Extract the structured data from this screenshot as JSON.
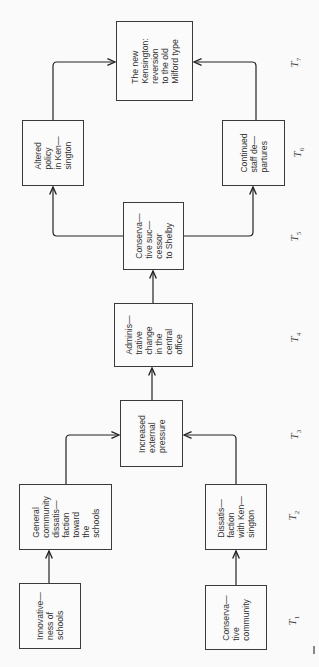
{
  "diagram": {
    "orientation": "rotated-90-ccw",
    "nodes": [
      {
        "id": "innovativeness",
        "label": "Innovative—\nness of\nschools",
        "time": "T1"
      },
      {
        "id": "conservative_community",
        "label": "Conserva—\ntive\ncommunity",
        "time": "T1"
      },
      {
        "id": "general_dissatisfaction",
        "label": "General\ncommunity\ndissatis—\nfaction\ntoward\nthe\nschools",
        "time": "T2"
      },
      {
        "id": "dissatisfaction_kensington",
        "label": "Dissatis—\nfaction\nwith Ken—\nsington",
        "time": "T2"
      },
      {
        "id": "external_pressure",
        "label": "Increased\nexternal\npressure",
        "time": "T3"
      },
      {
        "id": "admin_change",
        "label": "Adminis—\ntrative\nchange\nin the\ncentral\noffice",
        "time": "T4"
      },
      {
        "id": "conservative_successor",
        "label": "Conserva—\ntive suc—\ncessor\nto Shelby",
        "time": "T5"
      },
      {
        "id": "altered_policy",
        "label": "Altered\npolicy\nin Ken—\nsington",
        "time": "T6"
      },
      {
        "id": "staff_departures",
        "label": "Continued\nstaff de—\npartures",
        "time": "T6"
      },
      {
        "id": "new_kensington",
        "label": "The new\nKensington:\nreversion\nto the old\nMilford type",
        "time": "T7"
      }
    ],
    "edges": [
      [
        "innovativeness",
        "general_dissatisfaction"
      ],
      [
        "conservative_community",
        "dissatisfaction_kensington"
      ],
      [
        "general_dissatisfaction",
        "external_pressure"
      ],
      [
        "dissatisfaction_kensington",
        "external_pressure"
      ],
      [
        "external_pressure",
        "admin_change"
      ],
      [
        "admin_change",
        "conservative_successor"
      ],
      [
        "conservative_successor",
        "altered_policy"
      ],
      [
        "conservative_successor",
        "staff_departures"
      ],
      [
        "altered_policy",
        "new_kensington"
      ],
      [
        "staff_departures",
        "new_kensington"
      ]
    ],
    "time_labels": [
      {
        "base": "T",
        "sub": "1"
      },
      {
        "base": "T",
        "sub": "2"
      },
      {
        "base": "T",
        "sub": "3"
      },
      {
        "base": "T",
        "sub": "4"
      },
      {
        "base": "T",
        "sub": "5"
      },
      {
        "base": "T",
        "sub": "6"
      },
      {
        "base": "T",
        "sub": "7"
      }
    ]
  }
}
